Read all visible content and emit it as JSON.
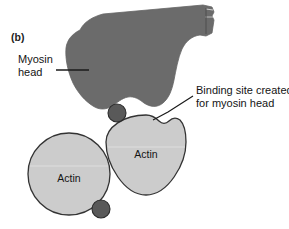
{
  "figure": {
    "panel_label": "(b)",
    "background_color": "#ffffff",
    "annotations": {
      "myosin_head": {
        "line1": "Myosin",
        "line2": "head",
        "leader": "horizontal-leader-line"
      },
      "binding_site": {
        "line1": "Binding site created",
        "line2": "for myosin head",
        "leader": "diagonal-leader-line"
      }
    },
    "shapes": {
      "myosin_head": {
        "name": "myosin-head-blob",
        "fill_color": "#6b6b6b",
        "stroke_color": "#5a5a5a"
      },
      "actin_left": {
        "name": "actin-monomer-left",
        "label": "Actin",
        "fill_color": "#cccccc",
        "stroke_color": "#333333",
        "cx": 69,
        "cy": 174,
        "r": 41
      },
      "actin_right": {
        "name": "actin-monomer-right",
        "label": "Actin",
        "fill_color": "#cccccc",
        "stroke_color": "#333333",
        "cx": 146,
        "cy": 155,
        "r": 40
      },
      "tropomyosin_upper": {
        "name": "regulatory-bead-upper",
        "fill_color": "#595959",
        "stroke_color": "#2b2b2b",
        "cx": 117,
        "cy": 113,
        "r": 9
      },
      "tropomyosin_lower": {
        "name": "regulatory-bead-lower",
        "fill_color": "#595959",
        "stroke_color": "#2b2b2b",
        "cx": 101,
        "cy": 209,
        "r": 9
      }
    }
  }
}
